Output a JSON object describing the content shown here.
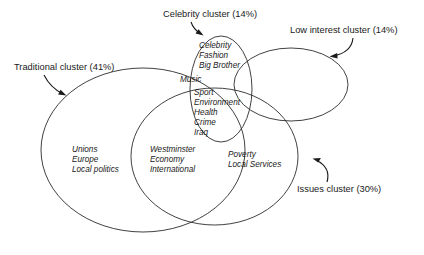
{
  "diagram": {
    "background_color": "#ffffff",
    "line_color": "#2b2b2b",
    "text_color": "#1a1a1a"
  },
  "clusters": [
    {
      "key": "celebrity",
      "callout": "Celebrity cluster (14%)",
      "percent": "14%",
      "name": "Celebrity cluster"
    },
    {
      "key": "low_interest",
      "callout": "Low interest cluster (14%)",
      "percent": "14%",
      "name": "Low interest cluster"
    },
    {
      "key": "traditional",
      "callout": "Traditional cluster (41%)",
      "percent": "41%",
      "name": "Traditional cluster"
    },
    {
      "key": "issues",
      "callout": "Issues cluster (30%)",
      "percent": "30%",
      "name": "Issues cluster"
    }
  ],
  "labels": {
    "celebrity_callout": "Celebrity cluster (14%)",
    "low_interest_callout": "Low interest cluster (14%)",
    "traditional_callout": "Traditional cluster (41%)",
    "issues_callout": "Issues cluster (30%)"
  },
  "topics": {
    "celebrity_only": [
      "Celebrity",
      "Fashion",
      "Big Brother"
    ],
    "music_band": [
      "Music"
    ],
    "shared_center": [
      "Sport",
      "Environment",
      "Health",
      "Crime",
      "Iraq"
    ],
    "traditional_only": [
      "Unions",
      "Europe",
      "Local politics"
    ],
    "traditional_issues": [
      "Westminster",
      "Economy",
      "International"
    ],
    "issues_right": [
      "Poverty",
      "Local Services"
    ]
  }
}
